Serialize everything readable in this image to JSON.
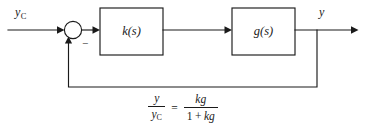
{
  "diagram": {
    "background_color": "#ffffff",
    "line_color": "#1a1a1a",
    "input": {
      "label_base": "y",
      "label_sub": "C",
      "name": "reference-input"
    },
    "summing_junction": {
      "negative_sign": "−",
      "name": "summing-junction"
    },
    "blocks": [
      {
        "label": "k(s)",
        "name": "controller-block"
      },
      {
        "label": "g(s)",
        "name": "plant-block"
      }
    ],
    "output": {
      "label": "y",
      "name": "output-signal"
    },
    "feedback": {
      "name": "feedback-path",
      "description": "unity negative feedback"
    }
  },
  "equation": {
    "lhs": {
      "numerator": "y",
      "denominator_base": "y",
      "denominator_sub": "C"
    },
    "equals": "=",
    "rhs": {
      "numerator": "kg",
      "denominator_one": "1",
      "denominator_plus": "+",
      "denominator_kg": "kg"
    }
  }
}
